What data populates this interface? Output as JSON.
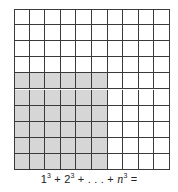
{
  "figure": {
    "grid": {
      "rows": 10,
      "cols": 10,
      "shaded": {
        "rows_from_bottom": 6,
        "cols_from_left": 6
      },
      "colors": {
        "line": "#3a3a3a",
        "shade": "#d6d6d6",
        "background": "#ffffff"
      }
    },
    "caption": {
      "terms": [
        {
          "base": "1",
          "exp": "3",
          "italic": false
        },
        {
          "sep": " + "
        },
        {
          "base": "2",
          "exp": "3",
          "italic": false
        },
        {
          "sep": " + . . . + "
        },
        {
          "base": "n",
          "exp": "3",
          "italic": true
        },
        {
          "sep": " ="
        }
      ]
    }
  }
}
